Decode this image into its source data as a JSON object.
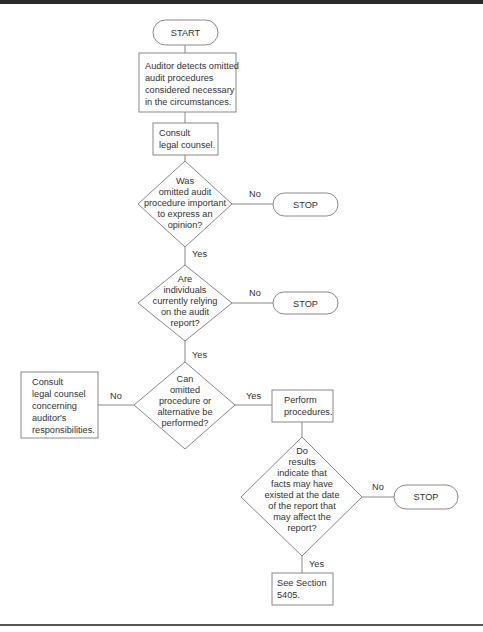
{
  "flowchart": {
    "start": {
      "label": "START"
    },
    "detect": {
      "lines": [
        "Auditor detects omitted",
        "audit procedures",
        "considered necessary",
        "in the circumstances."
      ]
    },
    "consult1": {
      "lines": [
        "Consult",
        "legal counsel."
      ]
    },
    "decision1": {
      "lines": [
        "Was",
        "omitted audit",
        "procedure important",
        "to express an",
        "opinion?"
      ],
      "no_label": "No",
      "yes_label": "Yes"
    },
    "stop1": {
      "label": "STOP"
    },
    "decision2": {
      "lines": [
        "Are",
        "individuals",
        "currently relying",
        "on the audit",
        "report?"
      ],
      "no_label": "No",
      "yes_label": "Yes"
    },
    "stop2": {
      "label": "STOP"
    },
    "decision3": {
      "lines": [
        "Can",
        "omitted",
        "procedure or",
        "alternative be",
        "performed?"
      ],
      "no_label": "No",
      "yes_label": "Yes"
    },
    "consult2": {
      "lines": [
        "Consult",
        "legal counsel",
        "concerning",
        "auditor's",
        "responsibilities."
      ]
    },
    "perform": {
      "lines": [
        "Perform",
        "procedures."
      ]
    },
    "decision4": {
      "lines": [
        "Do",
        "results",
        "indicate that",
        "facts may have",
        "existed at the date",
        "of the report that",
        "may affect the",
        "report?"
      ],
      "no_label": "No",
      "yes_label": "Yes"
    },
    "stop3": {
      "label": "STOP"
    },
    "section": {
      "lines": [
        "See Section",
        "5405."
      ]
    }
  }
}
